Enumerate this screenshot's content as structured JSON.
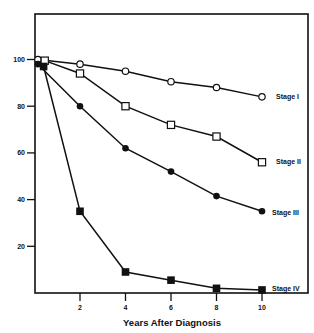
{
  "chart_data": {
    "type": "line",
    "title": "",
    "xlabel": "Years After Diagnosis",
    "ylabel": "",
    "xlim": [
      0,
      10.8
    ],
    "ylim": [
      0,
      119
    ],
    "x_ticks": [
      2,
      4,
      6,
      8,
      10
    ],
    "x_tick_labels": [
      "2",
      "4",
      "6",
      "8",
      "10"
    ],
    "y_ticks": [
      20,
      40,
      60,
      80,
      100
    ],
    "y_tick_labels": [
      "20",
      "40",
      "60",
      "80",
      "100"
    ],
    "grid": false,
    "legend_position": "inline-right",
    "series": [
      {
        "name": "Stage I",
        "marker": "open-circle",
        "x": [
          0.15,
          2,
          4,
          6,
          8,
          10
        ],
        "values": [
          100,
          98,
          95,
          90.5,
          88,
          84
        ]
      },
      {
        "name": "Stage II",
        "marker": "open-square",
        "x": [
          0.45,
          2,
          4,
          6,
          8,
          10
        ],
        "values": [
          99.5,
          94,
          80,
          72,
          67,
          56
        ]
      },
      {
        "name": "Stage III",
        "marker": "filled-circle",
        "x": [
          0.15,
          2,
          4,
          6,
          8,
          10
        ],
        "values": [
          98,
          80,
          62,
          52,
          41.5,
          35
        ]
      },
      {
        "name": "Stage IV",
        "marker": "filled-square",
        "x": [
          0.4,
          2,
          4,
          6,
          8,
          10
        ],
        "values": [
          97,
          35,
          9,
          5.5,
          2,
          1.3
        ]
      }
    ]
  },
  "colors": {
    "line": "#111111",
    "background": "#ffffff"
  }
}
